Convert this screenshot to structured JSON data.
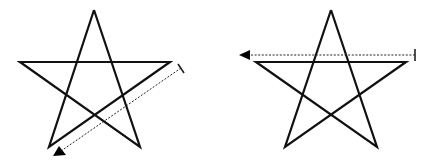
{
  "diagram": {
    "type": "pentagram-stroke-direction",
    "colors": {
      "stroke": "#111111",
      "background": "#ffffff"
    },
    "figures": [
      {
        "name": "left-star",
        "star_points": "94,10 140,147 20,62 170,62 49,147 94,10",
        "arrow": {
          "style": "dotted",
          "direction": "down-left (parallel to right-to-bottom-left edge)",
          "start": [
            181,
            68
          ],
          "end": [
            61,
            151
          ],
          "tick": "178,64 184,73",
          "head": "53,156 59,146 66,155"
        }
      },
      {
        "name": "right-star",
        "star_points": "331,10 377,147 256,62 406,62 285,147 331,10",
        "arrow": {
          "style": "dotted",
          "direction": "left (parallel to top horizontal edge)",
          "start": [
            415,
            55
          ],
          "end": [
            246,
            55
          ],
          "tick": "415,49 415,61",
          "head": "239,55 250,50 250,60"
        }
      }
    ]
  }
}
